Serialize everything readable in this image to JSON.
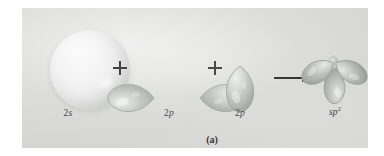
{
  "figure": {
    "caption": "(a)",
    "panel_background": "#dedfdd",
    "ink_color": "#1c1c1c"
  },
  "equation": {
    "terms": [
      {
        "id": "s-orbital",
        "label_prefix": "2",
        "label_italic": "s",
        "label_sup": "",
        "orbital_type": "s",
        "color": "#e9eae9",
        "lobes": 1
      },
      {
        "id": "p-orbital-horizontal",
        "label_prefix": "2",
        "label_italic": "p",
        "label_sup": "",
        "orbital_type": "p",
        "orientation": "horizontal",
        "color": "#b9bcb9",
        "lobes": 2
      },
      {
        "id": "p-orbital-vertical",
        "label_prefix": "2",
        "label_italic": "p",
        "label_sup": "",
        "orbital_type": "p",
        "orientation": "vertical",
        "color": "#b9bcb9",
        "lobes": 2
      },
      {
        "id": "sp2-hybrid-orbital",
        "label_prefix": "",
        "label_italic": "sp",
        "label_sup": "2",
        "orbital_type": "sp2",
        "color": "#b0b3b0",
        "lobes": 3,
        "lobe_angles_deg": [
          0,
          120,
          240
        ]
      }
    ],
    "operators": [
      {
        "id": "plus-1",
        "symbol": "+"
      },
      {
        "id": "plus-2",
        "symbol": "+"
      },
      {
        "id": "yields-arrow",
        "symbol": "→"
      }
    ]
  }
}
